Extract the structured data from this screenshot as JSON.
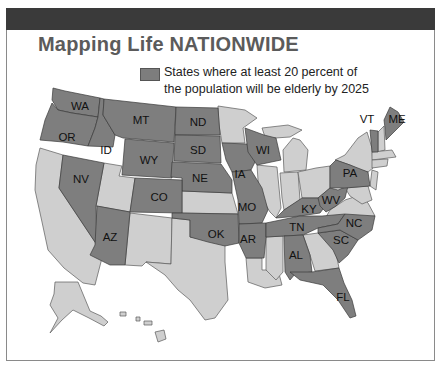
{
  "title": "Mapping Life NATIONWIDE",
  "legend": {
    "line1": "States where at least 20 percent of",
    "line2": "the population will be elderly by 2025",
    "swatch_color": "#7e7e7e"
  },
  "colors": {
    "highlighted": "#7e7e7e",
    "other": "#cfcfcf",
    "header_band": "#3a3a3a",
    "title": "#5b5b5b"
  },
  "highlighted_states": [
    "WA",
    "OR",
    "ID",
    "MT",
    "WY",
    "ND",
    "SD",
    "NE",
    "NV",
    "CO",
    "AZ",
    "OK",
    "IA",
    "MO",
    "AR",
    "WI",
    "KY",
    "TN",
    "AL",
    "FL",
    "SC",
    "NC",
    "WV",
    "PA",
    "VT",
    "ME"
  ],
  "labels": {
    "WA": "WA",
    "OR": "OR",
    "ID": "ID",
    "MT": "MT",
    "WY": "WY",
    "ND": "ND",
    "SD": "SD",
    "NE": "NE",
    "NV": "NV",
    "CO": "CO",
    "AZ": "AZ",
    "OK": "OK",
    "IA": "IA",
    "MO": "MO",
    "AR": "AR",
    "WI": "WI",
    "KY": "KY",
    "TN": "TN",
    "AL": "AL",
    "FL": "FL",
    "SC": "SC",
    "NC": "NC",
    "WV": "WV",
    "PA": "PA",
    "VT": "VT",
    "ME": "ME"
  }
}
